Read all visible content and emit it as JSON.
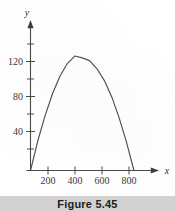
{
  "figure": {
    "caption": "Figure 5.45",
    "caption_band_color": "#d2d2d2",
    "background_color": "#ffffff",
    "ink_color": "#4a4a4a"
  },
  "chart_data": {
    "type": "line",
    "title": "",
    "subtitle": "",
    "xlabel": "x",
    "ylabel": "y",
    "xlim": [
      0,
      900
    ],
    "ylim": [
      0,
      145
    ],
    "grid": false,
    "legend": null,
    "x_ticks": [
      200,
      400,
      600,
      800
    ],
    "x_tick_labels": [
      "200",
      "400",
      "600",
      "800"
    ],
    "y_ticks": [
      40,
      80,
      120
    ],
    "y_tick_labels": [
      "40",
      "80",
      "120"
    ],
    "y_minor_ticks": [
      20,
      60,
      100,
      140
    ],
    "series": [
      {
        "name": "curve",
        "shape": "downward parabola",
        "x_intercepts": [
          0,
          840
        ],
        "vertex": [
          420,
          124
        ],
        "x": [
          0,
          60,
          120,
          180,
          240,
          300,
          360,
          420,
          480,
          540,
          600,
          660,
          720,
          780,
          840
        ],
        "y": [
          0,
          33,
          61,
          85,
          104,
          118,
          126,
          124,
          121,
          112,
          99,
          81,
          58,
          31,
          0
        ]
      }
    ],
    "annotations": []
  },
  "axis_labels": {
    "x_axis_name": "x",
    "y_axis_name": "y"
  }
}
